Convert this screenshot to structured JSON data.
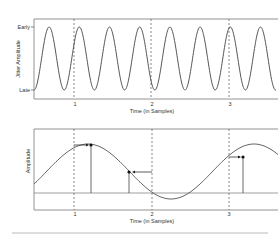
{
  "top_chart": {
    "ylabel": "Jitter Amplitude",
    "y_ticks": [
      "Early",
      "Late"
    ],
    "x_ticks": [
      "1",
      "2",
      "3"
    ],
    "xlabel": "Time (in Samples)"
  },
  "bottom_chart": {
    "ylabel": "Amplitude",
    "x_ticks": [
      "1",
      "2",
      "3"
    ],
    "xlabel": "Time (in Samples)"
  },
  "chart_data": [
    {
      "type": "line",
      "title": "",
      "xlabel": "Time (in Samples)",
      "ylabel": "Jitter Amplitude",
      "x_ticks": [
        "1",
        "2",
        "3"
      ],
      "y_ticks": [
        "Late",
        "Early"
      ],
      "series": [
        {
          "name": "jitter",
          "description": "sinusoidal jitter oscillating between Late and Early, ~2.6 cycles per sample period"
        }
      ],
      "grid": "dashed vertical lines at sample instants 1, 2, 3"
    },
    {
      "type": "line",
      "title": "",
      "xlabel": "Time (in Samples)",
      "ylabel": "Amplitude",
      "x_ticks": [
        "1",
        "2",
        "3"
      ],
      "series": [
        {
          "name": "signal",
          "description": "slow sinusoid; sampled points displaced by jitter arrows near samples 1, 2, 3"
        }
      ],
      "annotations": [
        "sample 1 shifted late (arrow right)",
        "sample 2 shifted early (arrow left)",
        "sample 3 shifted late (arrow right)"
      ]
    }
  ]
}
